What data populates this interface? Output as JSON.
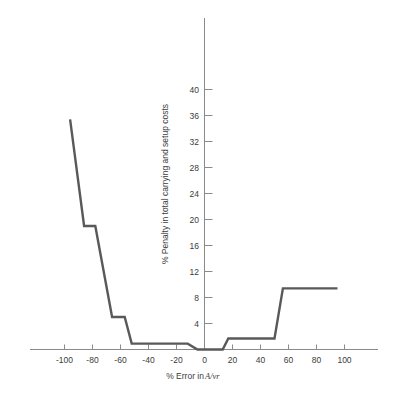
{
  "chart_data": {
    "type": "line",
    "title": "",
    "subtitle": "",
    "xlabel_prefix": "% Error in ",
    "xlabel_symbol": "A/vr",
    "xlabel": "% Error in A/vr",
    "ylabel": "% Penalty in total carrying and setup costs",
    "xlim": [
      -115,
      115
    ],
    "ylim": [
      0,
      43
    ],
    "xticks": [
      -100,
      -80,
      -60,
      -40,
      -20,
      0,
      20,
      40,
      60,
      80,
      100
    ],
    "xtick_labels": [
      "-100",
      "-80",
      "-60",
      "-40",
      "-20",
      "0",
      "20",
      "40",
      "60",
      "80",
      "100"
    ],
    "yticks": [
      4,
      8,
      12,
      16,
      20,
      24,
      28,
      32,
      36,
      40
    ],
    "ytick_labels": [
      "4",
      "8",
      "12",
      "16",
      "20",
      "24",
      "28",
      "32",
      "36",
      "40"
    ],
    "grid": false,
    "legend": null,
    "line_color": "#595959",
    "axis_color": "#8a8a8a",
    "series": [
      {
        "name": "Penalty curve",
        "x": [
          -96,
          -86,
          -86,
          -78,
          -78,
          -66,
          -66,
          -57,
          -57,
          -52,
          -52,
          -12,
          -12,
          -5,
          -5,
          13,
          13,
          17,
          17,
          50,
          50,
          56,
          56,
          95
        ],
        "y": [
          35.4,
          19.0,
          19.0,
          19.0,
          19.0,
          5.0,
          5.0,
          5.0,
          5.0,
          0.9,
          0.9,
          0.9,
          0.9,
          0.0,
          0.0,
          0.0,
          0.0,
          1.7,
          1.7,
          1.7,
          1.7,
          9.4,
          9.4,
          9.4
        ]
      }
    ],
    "annotations": []
  }
}
